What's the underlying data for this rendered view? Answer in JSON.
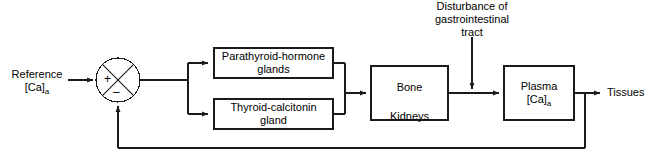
{
  "diagram": {
    "stroke_color": "#1a1a1a",
    "background_color": "#ffffff",
    "input": {
      "label_line1": "Reference",
      "label_line2_main": "[Ca]",
      "label_line2_sub": "a"
    },
    "summing_junction": {
      "name": "comparator",
      "plus_sign": "+",
      "minus_sign": "–"
    },
    "blocks": [
      {
        "id": "parathyroid",
        "line1": "Parathyroid-hormone",
        "line2": "glands"
      },
      {
        "id": "thyroid",
        "line1": "Thyroid-calcitonin",
        "line2": "gland"
      },
      {
        "id": "bone-kidneys",
        "line1": "Bone",
        "line2": "Kidneys"
      },
      {
        "id": "plasma",
        "line1": "Plasma",
        "line2_main": "[Ca]",
        "line2_sub": "a"
      }
    ],
    "disturbance": {
      "line1": "Disturbance of",
      "line2": "gastrointestinal",
      "line3": "tract"
    },
    "output": {
      "label": "Tissues"
    }
  }
}
